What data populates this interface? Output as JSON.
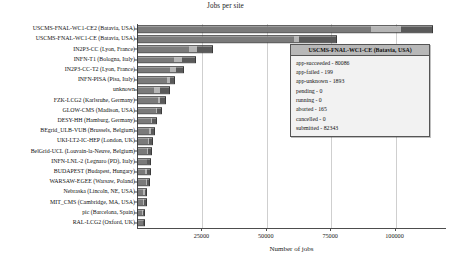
{
  "chart_data": {
    "type": "bar",
    "orientation": "horizontal",
    "stacked": true,
    "title": "Jobs per site",
    "xlabel": "Number of jobs",
    "ylabel": "",
    "xlim": [
      0,
      120000
    ],
    "xticks": [
      25000,
      50000,
      75000,
      100000
    ],
    "xtick_labels": [
      "25000",
      "50000",
      "75000",
      "100000"
    ],
    "grid": true,
    "legend": "none",
    "categories": [
      "USCMS-FNAL-WC1-CE2 (Batavia, USA)",
      "USCMS-FNAL-WC1-CE (Batavia, USA)",
      "IN2P3-CC (Lyon, France)",
      "INFN-T1 (Bologna, Italy)",
      "IN2P3-CC-T2 (Lyon, France)",
      "INFN-PISA (Pisa, Italy)",
      "unknown",
      "FZK-LCG2 (Karlsruhe, Germany)",
      "GLOW-CMS (Madison, USA)",
      "DESY-HH (Hamburg, Germany)",
      "BEgrid_ULB-VUB (Brussels, Belgium)",
      "UKI-LT2-IC-HEP (London, UK)",
      "BelGrid-UCL (Louvain-la-Neuve, Belgium)",
      "INFN-LNL-2 (Legnaro (PD), Italy)",
      "BUDAPEST (Budapest, Hungary)",
      "WARSAW-EGEE (Warsaw, Poland)",
      "Nebraska (Lincoln, NE, USA)",
      "MIT_CMS (Cambridge, MA, USA)",
      "pic (Barcelona, Spain)",
      "RAL-LCG2 (Oxford, UK)"
    ],
    "series": [
      {
        "name": "app-succeeded",
        "color": "#7a7a7a",
        "values": [
          91000,
          61000,
          20500,
          14500,
          13000,
          12000,
          6500,
          8500,
          7500,
          5600,
          4800,
          4300,
          4200,
          3900,
          3200,
          3700,
          2500,
          2600,
          2000,
          2300
        ]
      },
      {
        "name": "app-unknown",
        "color": "#b5b5b5",
        "values": [
          12000,
          2000,
          3200,
          3000,
          2400,
          1000,
          2700,
          800,
          600,
          500,
          900,
          700,
          400,
          400,
          900,
          300,
          700,
          400,
          600,
          400
        ]
      },
      {
        "name": "aborted",
        "color": "#5a5a5a",
        "values": [
          12000,
          14500,
          6000,
          5500,
          3000,
          1800,
          3500,
          2000,
          1600,
          1600,
          1400,
          1300,
          1100,
          1000,
          1200,
          1000,
          800,
          900,
          500,
          600
        ]
      }
    ],
    "totals": [
      115000,
      77500,
      29700,
      23000,
      18400,
      14800,
      12700,
      11300,
      9700,
      7700,
      7100,
      6300,
      5700,
      5300,
      5300,
      5000,
      4000,
      3900,
      3100,
      3300
    ]
  },
  "tooltip": {
    "title": "USCMS-FNAL-WC1-CE (Batavia, USA)",
    "lines": [
      "app-succeeded - 80086",
      "app-failed - 199",
      "app-unknown - 1893",
      "pending - 0",
      "running - 0",
      "aborted - 165",
      "cancelled - 0",
      "submitted - 82343"
    ]
  }
}
